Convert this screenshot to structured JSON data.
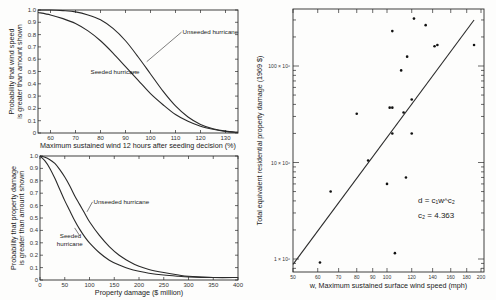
{
  "chart_data": [
    {
      "id": "wind-probability",
      "type": "line",
      "title": "",
      "xlabel": "Maximum sustained wind 12 hours after seeding decision (%)",
      "ylabel_line1": "Probability that wind speed",
      "ylabel_line2": "is greater than amount shown",
      "xlim": [
        55,
        135
      ],
      "ylim": [
        0,
        1.0
      ],
      "xticks": [
        60,
        70,
        80,
        90,
        100,
        110,
        120,
        130
      ],
      "yticks": [
        0,
        0.1,
        0.2,
        0.3,
        0.4,
        0.5,
        0.6,
        0.7,
        0.8,
        0.9,
        1.0
      ],
      "ytick_labels": [
        "0",
        "0.1",
        "0.2",
        "0.3",
        "0.4",
        "0.5",
        "0.6",
        "0.7",
        "0.8",
        "0.9",
        "1.0"
      ],
      "grid": false,
      "series": [
        {
          "name": "Unseeded hurricane",
          "x": [
            55,
            60,
            65,
            70,
            75,
            80,
            85,
            90,
            95,
            100,
            105,
            110,
            115,
            120,
            125,
            130,
            135
          ],
          "values": [
            1.0,
            1.0,
            0.995,
            0.985,
            0.96,
            0.92,
            0.85,
            0.75,
            0.62,
            0.48,
            0.34,
            0.22,
            0.13,
            0.07,
            0.035,
            0.015,
            0.005
          ]
        },
        {
          "name": "Seeded hurricane",
          "x": [
            55,
            60,
            65,
            70,
            75,
            80,
            85,
            90,
            95,
            100,
            105,
            110,
            115,
            120,
            125,
            130,
            135
          ],
          "values": [
            0.98,
            0.96,
            0.93,
            0.89,
            0.83,
            0.75,
            0.65,
            0.54,
            0.43,
            0.32,
            0.23,
            0.15,
            0.095,
            0.055,
            0.03,
            0.013,
            0.005
          ]
        }
      ],
      "annotations": [
        {
          "text": "Unseeded hurricane",
          "x": 104,
          "y": 0.82
        },
        {
          "text": "Seeded hurricane",
          "x": 76,
          "y": 0.5
        }
      ]
    },
    {
      "id": "damage-probability",
      "type": "line",
      "title": "",
      "xlabel": "Property damage ($ million)",
      "ylabel_line1": "Probability that property damage",
      "ylabel_line2": "is greater than amount shown",
      "xlim": [
        0,
        400
      ],
      "ylim": [
        0,
        1.0
      ],
      "xticks": [
        0,
        50,
        100,
        150,
        200,
        250,
        300,
        350,
        400
      ],
      "yticks": [
        0,
        0.1,
        0.2,
        0.3,
        0.4,
        0.5,
        0.6,
        0.7,
        0.8,
        0.9,
        1.0
      ],
      "ytick_labels": [
        "0",
        "0.1",
        "0.2",
        "0.3",
        "0.4",
        "0.5",
        "0.6",
        "0.7",
        "0.8",
        "0.9",
        "1.0"
      ],
      "grid": false,
      "series": [
        {
          "name": "Unseeded hurricane",
          "x": [
            0,
            10,
            20,
            30,
            40,
            50,
            60,
            70,
            80,
            90,
            100,
            120,
            140,
            160,
            180,
            200,
            220,
            250,
            280,
            300,
            350,
            400
          ],
          "values": [
            1.0,
            0.99,
            0.97,
            0.94,
            0.89,
            0.83,
            0.76,
            0.68,
            0.61,
            0.54,
            0.47,
            0.36,
            0.27,
            0.2,
            0.15,
            0.11,
            0.085,
            0.06,
            0.04,
            0.03,
            0.02,
            0.02
          ]
        },
        {
          "name": "Seeded hurricane",
          "x": [
            0,
            10,
            20,
            30,
            40,
            50,
            60,
            70,
            80,
            90,
            100,
            120,
            140,
            160,
            180,
            200,
            220,
            250,
            280,
            300,
            350,
            400
          ],
          "values": [
            1.0,
            0.96,
            0.9,
            0.82,
            0.73,
            0.64,
            0.56,
            0.48,
            0.41,
            0.35,
            0.3,
            0.22,
            0.16,
            0.12,
            0.09,
            0.07,
            0.055,
            0.04,
            0.03,
            0.025,
            0.02,
            0.02
          ]
        }
      ],
      "annotations": [
        {
          "text": "Unseeded hurricane",
          "x": 108,
          "y": 0.63
        },
        {
          "text_line1": "Seeded",
          "text_line2": "hurricane",
          "x": 40,
          "y": 0.34
        }
      ]
    },
    {
      "id": "damage-vs-wind",
      "type": "scatter",
      "title": "",
      "xlabel": "w, Maximum sustained surface wind speed (mph)",
      "ylabel": "Total equivalent residential property damage (1969 $)",
      "xscale": "log",
      "yscale": "log",
      "xlim": [
        50,
        200
      ],
      "ylim": [
        0.87,
        450
      ],
      "y_units": "millions of 1969 $",
      "xticks": [
        50,
        60,
        70,
        80,
        90,
        100,
        120,
        140,
        160,
        180,
        200
      ],
      "ytick_labels": [
        "1 × 10⁶",
        "10 × 10⁶",
        "100 × 10⁶"
      ],
      "ytick_values": [
        1,
        10,
        100
      ],
      "grid": false,
      "points": [
        {
          "x": 61,
          "y": 0.92
        },
        {
          "x": 66,
          "y": 5.0
        },
        {
          "x": 80,
          "y": 32
        },
        {
          "x": 87,
          "y": 10.5
        },
        {
          "x": 100,
          "y": 6.0
        },
        {
          "x": 102,
          "y": 37
        },
        {
          "x": 104,
          "y": 37
        },
        {
          "x": 104,
          "y": 20
        },
        {
          "x": 104,
          "y": 230
        },
        {
          "x": 106,
          "y": 1.15
        },
        {
          "x": 111,
          "y": 90
        },
        {
          "x": 113,
          "y": 33
        },
        {
          "x": 115,
          "y": 7.0
        },
        {
          "x": 116,
          "y": 125
        },
        {
          "x": 120,
          "y": 45
        },
        {
          "x": 120,
          "y": 20
        },
        {
          "x": 122,
          "y": 310
        },
        {
          "x": 133,
          "y": 265
        },
        {
          "x": 142,
          "y": 160
        },
        {
          "x": 145,
          "y": 165
        },
        {
          "x": 190,
          "y": 165
        }
      ],
      "fit_line": {
        "x": [
          50,
          190
        ],
        "y": [
          0.88,
          300
        ]
      },
      "annotations": {
        "equation": "d = c₁w^c₂",
        "coefficient": "c₂ = 4.363"
      }
    }
  ]
}
